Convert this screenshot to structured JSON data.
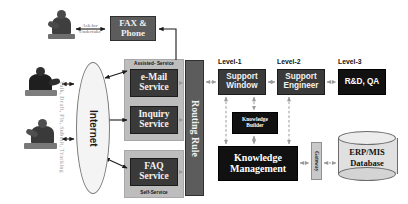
{
  "diagram": {
    "side_caption": "Talk, Draft, Fix, Submit, Tracking",
    "ask_caption_line1": "Ask for",
    "ask_caption_line2": "Undertake",
    "internet_label": "Internet",
    "group_assisted_label": "Assisted- Service",
    "group_self_label": "Self-Service"
  },
  "channels": {
    "fax_line1": "FAX &",
    "fax_line2": "Phone",
    "email_line1": "e-Mail",
    "email_line2": "Service",
    "inquiry_line1": "Inquiry",
    "inquiry_line2": "Service",
    "faq_line1": "FAQ",
    "faq_line2": "Service"
  },
  "router": {
    "label": "Routing Rule"
  },
  "levels": [
    {
      "header": "Level-1",
      "node_line1": "Support",
      "node_line2": "Window"
    },
    {
      "header": "Level-2",
      "node_line1": "Support",
      "node_line2": "Engineer"
    },
    {
      "header": "Level-3",
      "node_line1": "R&D, QA",
      "node_line2": ""
    }
  ],
  "knowledge": {
    "builder_line1": "Knowledge",
    "builder_line2": "Builder",
    "management_line1": "Knowledge",
    "management_line2": "Management"
  },
  "backend": {
    "gateway_label": "Gateway",
    "database_line1": "ERP/MIS",
    "database_line2": "Database"
  },
  "colors": {
    "box_dark": "#3a3a3a",
    "box_very_dark": "#111111",
    "box_mid": "#5c5c5c",
    "box_light": "#c9c9c9",
    "group_fill": "#bdbdbd",
    "arrow_solid": "#1a1a1a",
    "arrow_light": "#b0b0b0"
  }
}
